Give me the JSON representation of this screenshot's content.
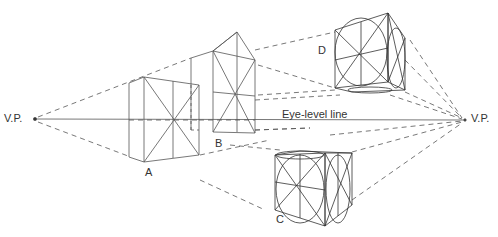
{
  "diagram": {
    "labels": {
      "vp_left": "V.P.",
      "vp_right": "V.P.",
      "eye_level": "Eye-level line",
      "box_a": "A",
      "box_b": "B",
      "box_c": "C",
      "box_d": "D"
    },
    "colors": {
      "line": "#555555",
      "text": "#333333",
      "background": "#ffffff"
    }
  }
}
